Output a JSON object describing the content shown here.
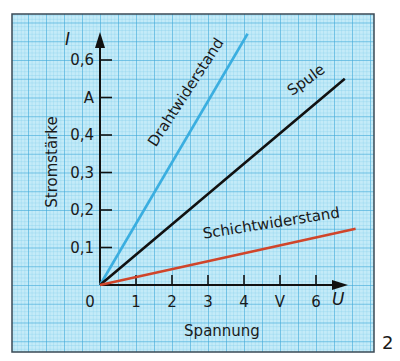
{
  "figure_number": "2",
  "colors": {
    "paper": "#c4ebf8",
    "grid_minor": "#7ccbea",
    "grid_major": "#3aa6d8",
    "frame": "#3a4a55",
    "axis": "#111111"
  },
  "chart_data": {
    "type": "line",
    "title": "",
    "xlabel": "Spannung",
    "xsymbol": "U",
    "xunit": "V",
    "ylabel": "Stromstärke",
    "ysymbol": "I",
    "yunit": "A",
    "xlim": [
      0,
      7.3
    ],
    "ylim": [
      0,
      0.68
    ],
    "x_ticks": [
      {
        "value": 0,
        "label": "0"
      },
      {
        "value": 1,
        "label": "1"
      },
      {
        "value": 2,
        "label": "2"
      },
      {
        "value": 3,
        "label": "3"
      },
      {
        "value": 4,
        "label": "4"
      },
      {
        "value": 5,
        "label": "V"
      },
      {
        "value": 6,
        "label": "6"
      }
    ],
    "y_ticks": [
      {
        "value": 0.1,
        "label": "0,1"
      },
      {
        "value": 0.2,
        "label": "0,2"
      },
      {
        "value": 0.3,
        "label": "0,3"
      },
      {
        "value": 0.4,
        "label": "0,4"
      },
      {
        "value": 0.5,
        "label": "A"
      },
      {
        "value": 0.6,
        "label": "0,6"
      }
    ],
    "grid": true,
    "legend": "inline labels along lines",
    "series": [
      {
        "name": "Drahtwiderstand",
        "color": "#3aaee0",
        "x": [
          0,
          4.1
        ],
        "y": [
          0,
          0.67
        ]
      },
      {
        "name": "Spule",
        "color": "#111111",
        "x": [
          0,
          6.8
        ],
        "y": [
          0,
          0.55
        ]
      },
      {
        "name": "Schichtwiderstand",
        "color": "#d0452a",
        "x": [
          0,
          7.1
        ],
        "y": [
          0,
          0.15
        ]
      }
    ]
  }
}
